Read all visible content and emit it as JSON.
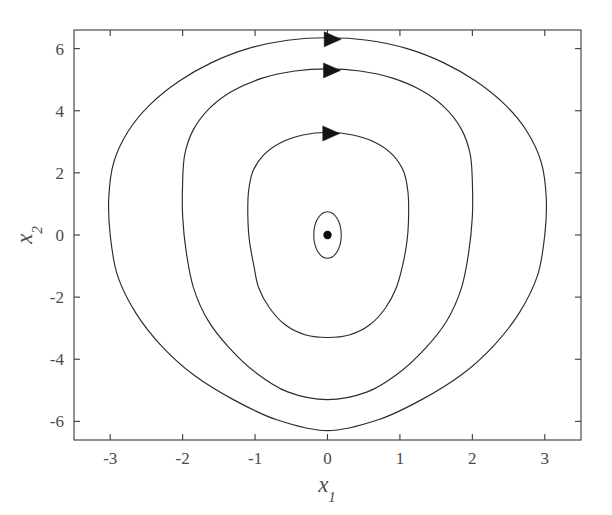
{
  "chart_data": {
    "type": "line",
    "title": "",
    "subtitle": "",
    "xlabel": "x",
    "xlabel_sub": "1",
    "ylabel": "x",
    "ylabel_sub": "2",
    "xlim": [
      -3.5,
      3.5
    ],
    "ylim": [
      -6.6,
      6.6
    ],
    "xticks": [
      -3,
      -2,
      -1,
      0,
      1,
      2,
      3
    ],
    "xticklabels": [
      "-3",
      "-2",
      "-1",
      "0",
      "1",
      "2",
      "3"
    ],
    "yticks": [
      -6,
      -4,
      -2,
      0,
      2,
      4,
      6
    ],
    "yticklabels": [
      "-6",
      "-4",
      "-2",
      "0",
      "2",
      "4",
      "6"
    ],
    "grid": false,
    "legend": "none",
    "series": [
      {
        "name": "orbit-outer",
        "closed": true,
        "x_extent": [
          -3.0,
          3.0
        ],
        "y_extent": [
          -6.3,
          6.35
        ],
        "shape": "diamond-rounded",
        "points": [
          [
            0.0,
            6.35
          ],
          [
            0.55,
            6.27
          ],
          [
            1.1,
            6.0
          ],
          [
            1.6,
            5.55
          ],
          [
            2.05,
            4.95
          ],
          [
            2.45,
            4.2
          ],
          [
            2.75,
            3.35
          ],
          [
            2.95,
            2.35
          ],
          [
            3.02,
            1.2
          ],
          [
            3.0,
            0.0
          ],
          [
            2.9,
            -1.3
          ],
          [
            2.65,
            -2.5
          ],
          [
            2.3,
            -3.55
          ],
          [
            1.85,
            -4.5
          ],
          [
            1.3,
            -5.3
          ],
          [
            0.7,
            -5.95
          ],
          [
            0.0,
            -6.3
          ],
          [
            -0.7,
            -5.95
          ],
          [
            -1.3,
            -5.3
          ],
          [
            -1.85,
            -4.5
          ],
          [
            -2.3,
            -3.55
          ],
          [
            -2.65,
            -2.5
          ],
          [
            -2.9,
            -1.3
          ],
          [
            -3.0,
            0.0
          ],
          [
            -3.02,
            1.2
          ],
          [
            -2.95,
            2.35
          ],
          [
            -2.75,
            3.35
          ],
          [
            -2.45,
            4.2
          ],
          [
            -2.05,
            4.95
          ],
          [
            -1.6,
            5.55
          ],
          [
            -1.1,
            6.0
          ],
          [
            -0.55,
            6.27
          ]
        ],
        "arrow": {
          "x": 0.06,
          "y": 6.3,
          "direction": "right"
        }
      },
      {
        "name": "orbit-middle",
        "closed": true,
        "x_extent": [
          -2.0,
          2.0
        ],
        "y_extent": [
          -5.3,
          5.35
        ],
        "shape": "oval-rounded",
        "points": [
          [
            0.0,
            5.35
          ],
          [
            0.45,
            5.28
          ],
          [
            0.9,
            5.05
          ],
          [
            1.3,
            4.65
          ],
          [
            1.62,
            4.1
          ],
          [
            1.85,
            3.4
          ],
          [
            1.97,
            2.6
          ],
          [
            2.0,
            1.7
          ],
          [
            2.0,
            0.6
          ],
          [
            1.95,
            -0.55
          ],
          [
            1.85,
            -1.7
          ],
          [
            1.65,
            -2.75
          ],
          [
            1.35,
            -3.65
          ],
          [
            0.98,
            -4.45
          ],
          [
            0.55,
            -5.05
          ],
          [
            0.0,
            -5.3
          ],
          [
            -0.55,
            -5.05
          ],
          [
            -0.98,
            -4.45
          ],
          [
            -1.35,
            -3.65
          ],
          [
            -1.65,
            -2.75
          ],
          [
            -1.85,
            -1.7
          ],
          [
            -1.95,
            -0.55
          ],
          [
            -2.0,
            0.6
          ],
          [
            -2.0,
            1.7
          ],
          [
            -1.97,
            2.6
          ],
          [
            -1.85,
            3.4
          ],
          [
            -1.62,
            4.1
          ],
          [
            -1.3,
            4.65
          ],
          [
            -0.9,
            5.05
          ],
          [
            -0.45,
            5.28
          ]
        ],
        "arrow": {
          "x": 0.05,
          "y": 5.3,
          "direction": "right"
        }
      },
      {
        "name": "orbit-inner",
        "closed": true,
        "x_extent": [
          -1.1,
          1.12
        ],
        "y_extent": [
          -3.3,
          3.3
        ],
        "shape": "ellipse",
        "points": [
          [
            0.0,
            3.3
          ],
          [
            0.35,
            3.22
          ],
          [
            0.66,
            2.98
          ],
          [
            0.9,
            2.58
          ],
          [
            1.05,
            2.05
          ],
          [
            1.11,
            1.4
          ],
          [
            1.12,
            0.65
          ],
          [
            1.1,
            -0.15
          ],
          [
            1.04,
            -0.95
          ],
          [
            0.95,
            -1.7
          ],
          [
            0.8,
            -2.35
          ],
          [
            0.58,
            -2.9
          ],
          [
            0.3,
            -3.22
          ],
          [
            0.0,
            -3.3
          ],
          [
            -0.3,
            -3.22
          ],
          [
            -0.58,
            -2.9
          ],
          [
            -0.8,
            -2.35
          ],
          [
            -0.95,
            -1.7
          ],
          [
            -1.02,
            -0.95
          ],
          [
            -1.08,
            -0.15
          ],
          [
            -1.1,
            0.65
          ],
          [
            -1.09,
            1.4
          ],
          [
            -1.03,
            2.05
          ],
          [
            -0.88,
            2.58
          ],
          [
            -0.64,
            2.98
          ],
          [
            -0.34,
            3.22
          ]
        ],
        "arrow": {
          "x": 0.04,
          "y": 3.27,
          "direction": "right"
        }
      },
      {
        "name": "orbit-innermost-oval",
        "closed": true,
        "x_extent": [
          -0.19,
          0.19
        ],
        "y_extent": [
          -0.75,
          0.75
        ],
        "shape": "tiny-ellipse",
        "points": [],
        "arrow": null
      }
    ],
    "markers": [
      {
        "name": "equilibrium-point",
        "x": 0.0,
        "y": 0.0,
        "style": "filled-circle",
        "color": "#0d0d0d"
      }
    ],
    "colors": {
      "curve": "#2b2b2b",
      "axis": "#3a3a3a",
      "text": "#4a4a4a",
      "marker": "#0d0d0d",
      "background": "#ffffff"
    }
  }
}
